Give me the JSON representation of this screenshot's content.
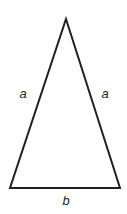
{
  "figure": {
    "type": "geometry-diagram",
    "shape": "isosceles-triangle",
    "background_color": "#ffffff",
    "stroke_color": "#231f20",
    "stroke_width": 2,
    "fill": "none",
    "canvas": {
      "width": 127,
      "height": 214
    },
    "vertices": {
      "apex": {
        "x": 66,
        "y": 19
      },
      "bottom_left": {
        "x": 10,
        "y": 188
      },
      "bottom_right": {
        "x": 120,
        "y": 188
      }
    },
    "polygon_points": "66,19 120,188 10,188"
  },
  "labels": {
    "left_side": "a",
    "right_side": "a",
    "base": "b"
  }
}
